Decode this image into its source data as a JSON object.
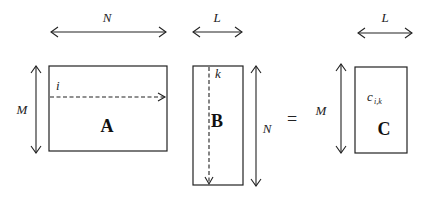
{
  "diagram": {
    "type": "matrix-multiplication",
    "matrices": {
      "A": {
        "label": "A",
        "row_label": "M",
        "col_label": "N",
        "index_label": "i"
      },
      "B": {
        "label": "B",
        "row_label": "N",
        "col_label": "L",
        "index_label": "k"
      },
      "C": {
        "label": "C",
        "row_label": "M",
        "col_label": "L",
        "element_base": "c",
        "element_sub": "i,k"
      }
    },
    "operator": "="
  }
}
